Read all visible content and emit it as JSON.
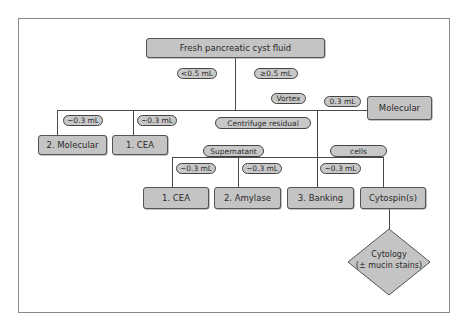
{
  "diagram": {
    "type": "flowchart",
    "title": "",
    "root": {
      "label": "Fresh pancreatic cyst fluid"
    },
    "branch_labels": {
      "less_than": "<0.5 mL",
      "greater_equal": "≥0.5  mL",
      "vortex": "Vortex",
      "molecular_volume": "0.3 mL",
      "left_molecular_volume": "~0.3 mL",
      "left_cea_volume": "~0.3 mL",
      "centrifuge": "Centrifuge residual",
      "supernatant": "Supernatant",
      "cells": "cells",
      "sup_cea_volume": "~0.3 mL",
      "sup_amylase_volume": "~0.3 mL",
      "banking_volume": "~0.3 mL"
    },
    "nodes": {
      "molecular_right": "Molecular",
      "molecular_left": "2. Molecular",
      "cea_left": "1. CEA",
      "cea_sup": "1. CEA",
      "amylase": "2. Amylase",
      "banking": "3. Banking",
      "cytospin": "Cytospin(s)",
      "cytology_line1": "Cytology",
      "cytology_line2": "(± mucin stains)"
    },
    "colors": {
      "node_fill": "#c4c4c4",
      "pill_fill": "#c8c8c8",
      "line": "#4a4a4a",
      "frame": "#8a8a8a"
    }
  }
}
